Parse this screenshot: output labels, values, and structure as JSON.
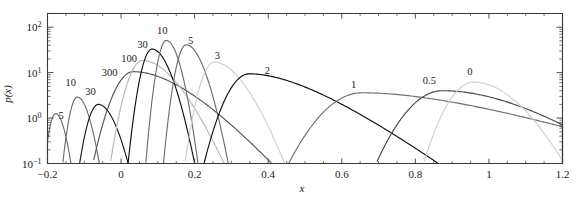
{
  "chart_data": {
    "type": "line",
    "title": "",
    "xlabel": "x",
    "ylabel": "p(x)",
    "yscale": "log",
    "xscale": "linear",
    "xlim": [
      -0.2,
      1.2
    ],
    "ylim": [
      0.1,
      200
    ],
    "grid": false,
    "legend_position": "inline-curve-labels",
    "xticks": [
      -0.2,
      0,
      0.2,
      0.4,
      0.6,
      0.8,
      1.0,
      1.2
    ],
    "xtick_labels": [
      "-0.2",
      "0",
      "0.2",
      "0.4",
      "0.6",
      "0.8",
      "1",
      "1.2"
    ],
    "yticks": [
      0.1,
      1,
      10,
      100
    ],
    "ytick_labels": [
      "10⁻¹",
      "10⁰",
      "10¹",
      "10²"
    ],
    "series": [
      {
        "name": "5",
        "label": "5",
        "color": "#6e6e6e",
        "peak_x": -0.178,
        "peak_y": 1.25,
        "width": 0.022,
        "skew": 0.25,
        "label_x": -0.163,
        "label_y": 0.95
      },
      {
        "name": "10",
        "label": "10",
        "color": "#6e6e6e",
        "peak_x": -0.119,
        "peak_y": 2.9,
        "width": 0.026,
        "skew": 0.3,
        "label_x": -0.137,
        "label_y": 5.2
      },
      {
        "name": "30",
        "label": "30",
        "color": "#1c1c1c",
        "peak_x": -0.062,
        "peak_y": 2.0,
        "width": 0.036,
        "skew": 0.35,
        "label_x": -0.083,
        "label_y": 3.2
      },
      {
        "name": "300",
        "label": "300",
        "color": "#555555",
        "peak_x": 0.033,
        "peak_y": 10.5,
        "width": 0.075,
        "skew": 1.1,
        "label_x": -0.031,
        "label_y": 8.6
      },
      {
        "name": "100",
        "label": "100",
        "color": "#b8b8b8",
        "peak_x": 0.058,
        "peak_y": 18.5,
        "width": 0.053,
        "skew": 0.75,
        "label_x": 0.022,
        "label_y": 17.5
      },
      {
        "name": "30b",
        "label": "30",
        "color": "#111111",
        "peak_x": 0.084,
        "peak_y": 33.0,
        "width": 0.034,
        "skew": 0.42,
        "label_x": 0.058,
        "label_y": 35.0
      },
      {
        "name": "10b",
        "label": "10",
        "color": "#6e6e6e",
        "peak_x": 0.123,
        "peak_y": 51.0,
        "width": 0.027,
        "skew": 0.3,
        "label_x": 0.112,
        "label_y": 70.0
      },
      {
        "name": "5b",
        "label": "5",
        "color": "#6e6e6e",
        "peak_x": 0.177,
        "peak_y": 41.0,
        "width": 0.032,
        "skew": 0.45,
        "label_x": 0.189,
        "label_y": 42.0
      },
      {
        "name": "3",
        "label": "3",
        "color": "#cfcfcf",
        "peak_x": 0.253,
        "peak_y": 17.0,
        "width": 0.048,
        "skew": 0.7,
        "label_x": 0.262,
        "label_y": 20.0
      },
      {
        "name": "2",
        "label": "2",
        "color": "#111111",
        "peak_x": 0.348,
        "peak_y": 9.4,
        "width": 0.085,
        "skew": 1.4,
        "label_x": 0.398,
        "label_y": 9.2
      },
      {
        "name": "1",
        "label": "1",
        "color": "#6e6e6e",
        "peak_x": 0.654,
        "peak_y": 3.6,
        "width": 0.155,
        "skew": 1.6,
        "label_x": 0.632,
        "label_y": 4.6
      },
      {
        "name": "0.5",
        "label": "0.5",
        "color": "#4a4a4a",
        "peak_x": 0.873,
        "peak_y": 4.0,
        "width": 0.135,
        "skew": 0.9,
        "label_x": 0.838,
        "label_y": 5.6
      },
      {
        "name": "0",
        "label": "0",
        "color": "#cfcfcf",
        "peak_x": 0.958,
        "peak_y": 6.2,
        "width": 0.085,
        "skew": 0.45,
        "label_x": 0.948,
        "label_y": 8.8
      }
    ]
  }
}
